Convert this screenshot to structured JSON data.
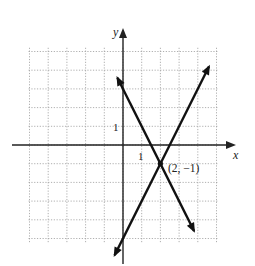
{
  "chart_data": {
    "type": "line",
    "title": "",
    "xlabel": "x",
    "ylabel": "y",
    "xlim": [
      -5,
      5
    ],
    "ylim": [
      -5,
      5
    ],
    "grid": true,
    "tick_labels": {
      "x": [
        "1"
      ],
      "y": [
        "1"
      ]
    },
    "series": [
      {
        "name": "line-decreasing",
        "equation": "y = -2x + 3",
        "x": [
          -0.3,
          3.8
        ],
        "y": [
          3.6,
          -4.6
        ]
      },
      {
        "name": "line-increasing",
        "equation": "y = 2x - 5",
        "x": [
          -0.45,
          4.6
        ],
        "y": [
          -5.9,
          4.2
        ]
      }
    ],
    "annotations": [
      {
        "point": [
          2,
          -1
        ],
        "text": "(2, −1)"
      }
    ]
  },
  "labels": {
    "x_axis": "x",
    "y_axis": "y",
    "x_tick": "1",
    "y_tick": "1",
    "intersection": "(2, −1)"
  }
}
